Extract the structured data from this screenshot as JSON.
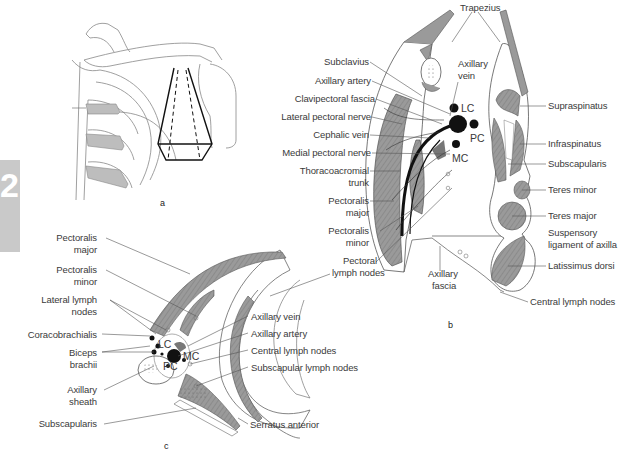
{
  "chapter_tab": {
    "number": "2",
    "color": "#c9c9c9"
  },
  "colors": {
    "muscle": "#9a9a9a",
    "rib_shade": "#bdbdbd",
    "vessel": "#111111",
    "outline": "#555555"
  },
  "panel_a": {
    "letter": "a",
    "description": "Anterior view of right shoulder girdle with pyramid-shaped axilla outline"
  },
  "panel_b": {
    "letter": "b",
    "labels_left": {
      "subclavius": "Subclavius",
      "axillary_artery": "Axillary artery",
      "clavipectoral_fascia": "Clavipectoral fascia",
      "lateral_pectoral_nerve": "Lateral pectoral nerve",
      "cephalic_vein": "Cephalic vein",
      "medial_pectoral_nerve": "Medial pectoral nerve",
      "thoracoacromial_1": "Thoracoacromial",
      "thoracoacromial_2": "trunk",
      "pectoralis_major_1": "Pectoralis",
      "pectoralis_major_2": "major",
      "pectoralis_minor_1": "Pectoralis",
      "pectoralis_minor_2": "minor",
      "pectoral_nodes_1": "Pectoral",
      "pectoral_nodes_2": "lymph nodes"
    },
    "labels_top": {
      "trapezius": "Trapezius",
      "axillary_vein_1": "Axillary",
      "axillary_vein_2": "vein"
    },
    "cords": {
      "lc": "LC",
      "pc": "PC",
      "mc": "MC"
    },
    "labels_right": {
      "supraspinatus": "Supraspinatus",
      "infraspinatus": "Infraspinatus",
      "subscapularis": "Subscapularis",
      "teres_minor": "Teres minor",
      "teres_major": "Teres major",
      "suspensory_1": "Suspensory",
      "suspensory_2": "ligament of axilla",
      "latissimus": "Latissimus dorsi",
      "central_nodes": "Central lymph nodes"
    },
    "labels_bottom": {
      "axillary_fascia_1": "Axillary",
      "axillary_fascia_2": "fascia"
    }
  },
  "panel_c": {
    "letter": "c",
    "labels_left": {
      "pectoralis_major_1": "Pectoralis",
      "pectoralis_major_2": "major",
      "pectoralis_minor_1": "Pectoralis",
      "pectoralis_minor_2": "minor",
      "lateral_nodes_1": "Lateral lymph",
      "lateral_nodes_2": "nodes",
      "coracobrachialis": "Coracobrachialis",
      "biceps_1": "Biceps",
      "biceps_2": "brachii",
      "axillary_sheath_1": "Axillary",
      "axillary_sheath_2": "sheath",
      "subscapularis": "Subscapularis"
    },
    "cords": {
      "lc": "LC",
      "pc": "PC",
      "mc": "MC"
    },
    "labels_right": {
      "axillary_vein": "Axillary vein",
      "axillary_artery": "Axillary artery",
      "central_nodes": "Central lymph nodes",
      "subscapular_nodes": "Subscapular lymph nodes",
      "serratus": "Serratus anterior"
    }
  }
}
